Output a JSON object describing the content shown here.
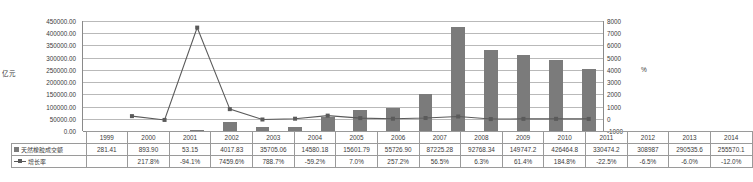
{
  "chart_data": {
    "type": "bar",
    "title": "",
    "subtitle": "",
    "xlabel": "",
    "ylabel": "亿元",
    "y2label": "%",
    "grid": true,
    "legend_position": "table-left",
    "categories": [
      "1999",
      "2000",
      "2001",
      "2002",
      "2003",
      "2004",
      "2005",
      "2006",
      "2007",
      "2008",
      "2009",
      "2010",
      "2011",
      "2012",
      "2013",
      "2014"
    ],
    "ylim": [
      0,
      450000
    ],
    "y2lim": [
      -1000,
      8000
    ],
    "yticks": [
      "0.00",
      "50000.00",
      "100000.00",
      "150000.00",
      "200000.00",
      "250000.00",
      "300000.00",
      "350000.00",
      "400000.00",
      "450000.00"
    ],
    "ytick_values": [
      0,
      50000,
      100000,
      150000,
      200000,
      250000,
      300000,
      350000,
      400000,
      450000
    ],
    "y2ticks": [
      "-1000",
      "0",
      "1000",
      "2000",
      "3000",
      "4000",
      "5000",
      "6000",
      "7000",
      "8000"
    ],
    "y2tick_values": [
      -1000,
      0,
      1000,
      2000,
      3000,
      4000,
      5000,
      6000,
      7000,
      8000
    ],
    "series": [
      {
        "name": "天然橡胶成交额",
        "type": "bar",
        "axis": "left",
        "color": "#7b7b7b",
        "values": [
          281.41,
          893.9,
          53.15,
          4017.83,
          35705.06,
          14580.18,
          15601.79,
          55726.9,
          87225.28,
          92768.34,
          149747.2,
          426464.8,
          330474.2,
          308987,
          290535.6,
          255570.1
        ],
        "labels": [
          "281.41",
          "893.90",
          "53.15",
          "4017.83",
          "35705.06",
          "14580.18",
          "15601.79",
          "55726.90",
          "87225.28",
          "92768.34",
          "149747.2",
          "426464.8",
          "330474.2",
          "308987",
          "290535.6",
          "255570.1"
        ]
      },
      {
        "name": "增长率",
        "type": "line",
        "axis": "right",
        "color": "#5a5a5a",
        "values": [
          null,
          217.8,
          -94.1,
          7459.6,
          788.7,
          -59.2,
          7.0,
          257.2,
          56.5,
          6.3,
          61.4,
          184.8,
          -22.5,
          -6.5,
          -6.0,
          -12.0
        ],
        "labels": [
          "",
          "217.8%",
          "-94.1%",
          "7459.6%",
          "788.7%",
          "-59.2%",
          "7.0%",
          "257.2%",
          "56.5%",
          "6.3%",
          "61.4%",
          "184.8%",
          "-22.5%",
          "-6.5%",
          "-6.0%",
          "-12.0%"
        ]
      }
    ]
  },
  "table": {
    "header_blank": "",
    "row_bar_label": "天然橡胶成交额",
    "row_line_label": "增长率"
  },
  "caption": ""
}
